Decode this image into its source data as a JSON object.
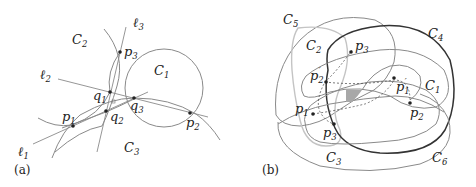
{
  "panels": [
    {
      "id": "a",
      "label": "(a)",
      "curves": [
        {
          "name": "C1",
          "label": "C",
          "sub": "1"
        },
        {
          "name": "C2",
          "label": "C",
          "sub": "2"
        },
        {
          "name": "C3",
          "label": "C",
          "sub": "3"
        }
      ],
      "lines": [
        {
          "name": "l1",
          "label": "ℓ",
          "sub": "1"
        },
        {
          "name": "l2",
          "label": "ℓ",
          "sub": "2"
        },
        {
          "name": "l3",
          "label": "ℓ",
          "sub": "3"
        }
      ],
      "points": [
        {
          "name": "p1",
          "label": "p",
          "sub": "1"
        },
        {
          "name": "p2",
          "label": "p",
          "sub": "2"
        },
        {
          "name": "p3",
          "label": "p",
          "sub": "3"
        },
        {
          "name": "q1",
          "label": "q",
          "sub": "1"
        },
        {
          "name": "q2",
          "label": "q",
          "sub": "2"
        },
        {
          "name": "q3",
          "label": "q",
          "sub": "3"
        }
      ]
    },
    {
      "id": "b",
      "label": "(b)",
      "curves": [
        {
          "name": "C1",
          "label": "C",
          "sub": "1"
        },
        {
          "name": "C2",
          "label": "C",
          "sub": "2"
        },
        {
          "name": "C3",
          "label": "C",
          "sub": "3"
        },
        {
          "name": "C4",
          "label": "C",
          "sub": "4"
        },
        {
          "name": "C5",
          "label": "C",
          "sub": "5"
        },
        {
          "name": "C6",
          "label": "C",
          "sub": "6"
        }
      ],
      "points": [
        {
          "name": "p1",
          "label": "p",
          "sub": "1"
        },
        {
          "name": "p2",
          "label": "p",
          "sub": "2"
        },
        {
          "name": "p3",
          "label": "p",
          "sub": "3"
        },
        {
          "name": "p1prime",
          "label": "p",
          "sub": "1",
          "prime": "′"
        },
        {
          "name": "p2prime",
          "label": "p",
          "sub": "2",
          "prime": "′"
        },
        {
          "name": "p3prime",
          "label": "p",
          "sub": "3",
          "prime": "′"
        }
      ]
    }
  ]
}
